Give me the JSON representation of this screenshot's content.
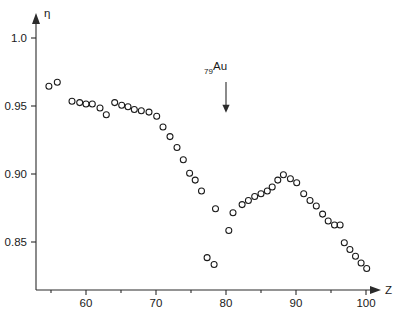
{
  "chart_data": {
    "type": "scatter",
    "title": "",
    "xlabel": "Z",
    "ylabel": "η",
    "xlim": [
      54,
      102
    ],
    "ylim": [
      0.825,
      1.01
    ],
    "grid": false,
    "legend": null,
    "marker": "open-circle",
    "xticks": [
      60,
      70,
      80,
      90,
      100
    ],
    "xticklabels": [
      "60",
      "70",
      "80",
      "90",
      "100"
    ],
    "xminorticks": [
      55,
      65,
      75,
      85,
      95
    ],
    "yticks": [
      0.85,
      0.9,
      0.95,
      1.0
    ],
    "yticklabels": [
      "0.85",
      "0.90",
      "0.95",
      "1.0"
    ],
    "annotations": [
      {
        "name": "gold-marker",
        "label_sub": "79",
        "label_main": "Au",
        "x": 80,
        "y": 0.975,
        "arrow": "down",
        "arrow_to_y": 0.945
      }
    ],
    "points": [
      {
        "x": 54.7,
        "y": 0.9645
      },
      {
        "x": 55.9,
        "y": 0.9675
      },
      {
        "x": 58.0,
        "y": 0.9535
      },
      {
        "x": 59.1,
        "y": 0.9525
      },
      {
        "x": 60.0,
        "y": 0.9515
      },
      {
        "x": 60.9,
        "y": 0.9515
      },
      {
        "x": 62.0,
        "y": 0.9485
      },
      {
        "x": 62.9,
        "y": 0.9435
      },
      {
        "x": 64.1,
        "y": 0.9525
      },
      {
        "x": 65.1,
        "y": 0.9505
      },
      {
        "x": 66.0,
        "y": 0.9495
      },
      {
        "x": 66.9,
        "y": 0.9475
      },
      {
        "x": 67.9,
        "y": 0.9465
      },
      {
        "x": 69.0,
        "y": 0.9455
      },
      {
        "x": 70.1,
        "y": 0.9425
      },
      {
        "x": 71.0,
        "y": 0.9345
      },
      {
        "x": 72.0,
        "y": 0.9275
      },
      {
        "x": 73.0,
        "y": 0.9195
      },
      {
        "x": 73.9,
        "y": 0.9105
      },
      {
        "x": 74.8,
        "y": 0.9005
      },
      {
        "x": 75.6,
        "y": 0.8955
      },
      {
        "x": 76.5,
        "y": 0.8875
      },
      {
        "x": 77.3,
        "y": 0.8385
      },
      {
        "x": 78.3,
        "y": 0.8335
      },
      {
        "x": 78.5,
        "y": 0.8745
      },
      {
        "x": 80.4,
        "y": 0.8585
      },
      {
        "x": 81.0,
        "y": 0.8715
      },
      {
        "x": 82.3,
        "y": 0.8775
      },
      {
        "x": 83.2,
        "y": 0.8805
      },
      {
        "x": 84.1,
        "y": 0.8835
      },
      {
        "x": 85.0,
        "y": 0.8855
      },
      {
        "x": 85.9,
        "y": 0.8875
      },
      {
        "x": 86.6,
        "y": 0.8905
      },
      {
        "x": 87.4,
        "y": 0.8955
      },
      {
        "x": 88.2,
        "y": 0.8995
      },
      {
        "x": 89.2,
        "y": 0.8965
      },
      {
        "x": 90.1,
        "y": 0.8935
      },
      {
        "x": 91.1,
        "y": 0.8855
      },
      {
        "x": 92.0,
        "y": 0.8805
      },
      {
        "x": 92.9,
        "y": 0.8765
      },
      {
        "x": 93.8,
        "y": 0.8705
      },
      {
        "x": 94.6,
        "y": 0.8655
      },
      {
        "x": 95.5,
        "y": 0.8625
      },
      {
        "x": 96.3,
        "y": 0.8625
      },
      {
        "x": 96.9,
        "y": 0.8495
      },
      {
        "x": 97.7,
        "y": 0.8445
      },
      {
        "x": 98.5,
        "y": 0.8395
      },
      {
        "x": 99.3,
        "y": 0.8345
      },
      {
        "x": 100.1,
        "y": 0.8305
      }
    ]
  }
}
